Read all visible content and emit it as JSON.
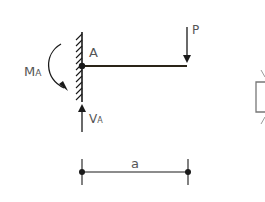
{
  "diagram": {
    "type": "cantilever-beam-free-body",
    "node_label": "A",
    "load_label": "P",
    "moment_label_main": "M",
    "moment_label_sub": "A",
    "shear_label_main": "V",
    "shear_label_sub": "A",
    "dimension_label": "a"
  },
  "colors": {
    "line": "#1a1a1a",
    "label": "#555555",
    "partial": "#777777"
  }
}
